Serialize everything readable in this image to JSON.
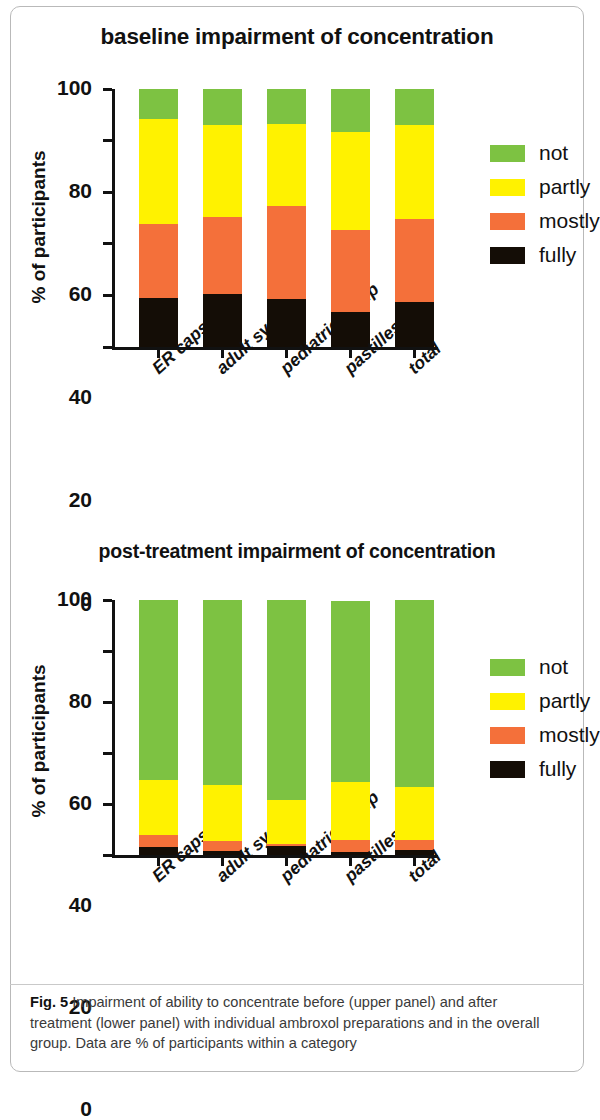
{
  "figure": {
    "label": "Fig. 5",
    "caption": "Impairment of ability to concentrate before (upper panel) and after treatment (lower panel) with individual ambroxol preparations and in the overall group. Data are % of participants within a category"
  },
  "colors": {
    "not": "#7dc242",
    "partly": "#fff200",
    "mostly": "#f4703a",
    "fully": "#140d06",
    "axis": "#111111"
  },
  "legend": {
    "items": [
      {
        "label": "not",
        "color": "#7dc242"
      },
      {
        "label": "partly",
        "color": "#fff200"
      },
      {
        "label": "mostly",
        "color": "#f4703a"
      },
      {
        "label": "fully",
        "color": "#140d06"
      }
    ]
  },
  "axis": {
    "ylabel": "% of participants",
    "yticks": [
      "0",
      "20",
      "40",
      "60",
      "80",
      "100"
    ],
    "ylim": [
      0,
      100
    ]
  },
  "chart_data": [
    {
      "type": "bar",
      "stacked": true,
      "title": "baseline impairment of concentration",
      "xlabel": "",
      "ylabel": "% of participants",
      "ylim": [
        0,
        100
      ],
      "yticks": [
        0,
        20,
        40,
        60,
        80,
        100
      ],
      "grid": false,
      "legend_position": "right",
      "categories": [
        "ER capsules",
        "adult syrup",
        "pediatric syrup",
        "pastilles",
        "total"
      ],
      "series": [
        {
          "name": "fully",
          "color": "#140d06",
          "values": [
            19.0,
            20.5,
            18.5,
            13.5,
            17.5
          ]
        },
        {
          "name": "mostly",
          "color": "#f4703a",
          "values": [
            28.5,
            30.0,
            36.0,
            32.0,
            32.0
          ]
        },
        {
          "name": "partly",
          "color": "#fff200",
          "values": [
            41.0,
            35.5,
            32.0,
            38.0,
            36.5
          ]
        },
        {
          "name": "not",
          "color": "#7dc242",
          "values": [
            11.5,
            14.0,
            13.5,
            16.5,
            14.0
          ]
        }
      ]
    },
    {
      "type": "bar",
      "stacked": true,
      "title": "post-treatment impairment of concentration",
      "xlabel": "",
      "ylabel": "% of participants",
      "ylim": [
        0,
        100
      ],
      "yticks": [
        0,
        20,
        40,
        60,
        80,
        100
      ],
      "grid": false,
      "legend_position": "right",
      "categories": [
        "ER capsules",
        "adult syrup",
        "pediatric syrup",
        "pastilles",
        "total"
      ],
      "series": [
        {
          "name": "fully",
          "color": "#140d06",
          "values": [
            3.0,
            1.5,
            3.5,
            1.0,
            2.0
          ]
        },
        {
          "name": "mostly",
          "color": "#f4703a",
          "values": [
            5.0,
            4.0,
            1.0,
            5.0,
            4.0
          ]
        },
        {
          "name": "partly",
          "color": "#fff200",
          "values": [
            21.5,
            22.0,
            17.0,
            22.5,
            20.5
          ]
        },
        {
          "name": "not",
          "color": "#7dc242",
          "values": [
            70.5,
            72.5,
            78.5,
            71.0,
            73.5
          ]
        }
      ]
    }
  ]
}
